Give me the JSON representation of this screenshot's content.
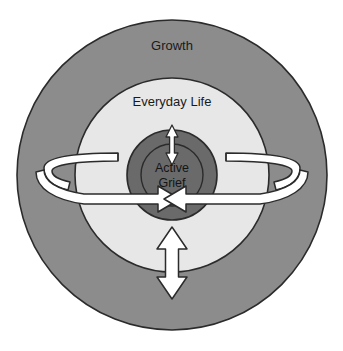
{
  "diagram": {
    "type": "concentric-circle-diagram",
    "background_color": "#ffffff",
    "center": {
      "x": 172,
      "y": 175
    },
    "rings": [
      {
        "id": "growth",
        "label": "Growth",
        "role": "outer-ring",
        "fill": "#8c8c8c",
        "stroke": "#2b2b2b",
        "radius": 155,
        "label_position": {
          "x": 172,
          "y": 47
        }
      },
      {
        "id": "everyday-life",
        "label": "Everyday Life",
        "role": "middle-ring",
        "fill": "#e7e7e7",
        "stroke": "#2b2b2b",
        "radius": 97,
        "label_position": {
          "x": 172,
          "y": 103
        }
      },
      {
        "id": "active-grief-disc",
        "label": "",
        "role": "inner-disc",
        "fill": "#6a6a6a",
        "stroke": "#2b2b2b",
        "radius": 45,
        "label_position": {
          "x": 172,
          "y": 175
        }
      },
      {
        "id": "active-grief-core",
        "label": "Active Grief",
        "role": "core-circle",
        "fill": "#6a6a6a",
        "stroke": "#2b2b2b",
        "radius": 31,
        "label_position": {
          "x": 172,
          "y": 175
        }
      }
    ],
    "core_label_lines": [
      "Active",
      "Grief"
    ],
    "arrows": [
      {
        "id": "left-loop-arrow",
        "name": "left-oscillation-loop-arrow",
        "kind": "3d-loop-ribbon",
        "direction": "inward-right",
        "fill": "#ffffff",
        "stroke": "#2b2b2b"
      },
      {
        "id": "right-loop-arrow",
        "name": "right-oscillation-loop-arrow",
        "kind": "3d-loop-ribbon",
        "direction": "inward-left",
        "fill": "#ffffff",
        "stroke": "#2b2b2b"
      },
      {
        "id": "top-double-arrow",
        "name": "upper-double-headed-arrow",
        "kind": "double-headed-vertical",
        "direction": "up-down",
        "fill": "#ffffff",
        "stroke": "#2b2b2b",
        "size": "small"
      },
      {
        "id": "bottom-double-arrow",
        "name": "lower-double-headed-arrow",
        "kind": "double-headed-vertical",
        "direction": "up-down",
        "fill": "#ffffff",
        "stroke": "#2b2b2b",
        "size": "large"
      }
    ]
  }
}
